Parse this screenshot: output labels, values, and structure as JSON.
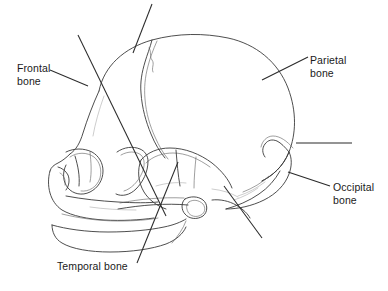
{
  "figure": {
    "background_color": "#ffffff",
    "line_color": "#3a3a3a",
    "text_color": "#1a1a1a"
  },
  "labels": {
    "frontal": {
      "line1": "Frontal",
      "line2": "bone"
    },
    "parietal": {
      "line1": "Parietal",
      "line2": "bone"
    },
    "occipital": {
      "line1": "Occipital",
      "line2": "bone"
    },
    "temporal": {
      "line1": "Temporal bone"
    }
  },
  "leader_lines": [
    {
      "name": "frontal-leader",
      "from": [
        50,
        70
      ],
      "to": [
        88,
        86
      ],
      "labeled": true
    },
    {
      "name": "parietal-leader",
      "from": [
        308,
        57
      ],
      "to": [
        262,
        80
      ],
      "labeled": true
    },
    {
      "name": "occipital-leader",
      "from": [
        330,
        186
      ],
      "to": [
        288,
        172
      ],
      "labeled": true
    },
    {
      "name": "temporal-leader",
      "from": [
        137,
        263
      ],
      "to": [
        178,
        162
      ],
      "labeled": true
    },
    {
      "name": "coronal-suture-leader",
      "from": [
        152,
        4
      ],
      "to": [
        133,
        53
      ],
      "labeled": false
    },
    {
      "name": "sphenoid-leader",
      "from": [
        78,
        35
      ],
      "to": [
        166,
        216
      ],
      "labeled": false
    },
    {
      "name": "lambdoid-leader",
      "from": [
        352,
        143
      ],
      "to": [
        296,
        143
      ],
      "labeled": false
    },
    {
      "name": "mastoid-leader",
      "from": [
        262,
        238
      ],
      "to": [
        224,
        186
      ],
      "labeled": false
    }
  ]
}
